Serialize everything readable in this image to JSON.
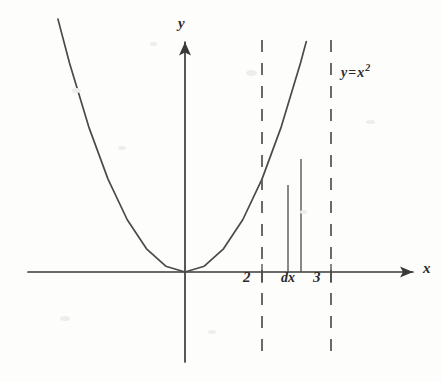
{
  "figure": {
    "kind": "math-graph",
    "background_color": "#fdfdfc",
    "ink_color": "#3a3a3a",
    "width": 442,
    "height": 382
  },
  "axes": {
    "y_axis_label": "y",
    "x_axis_label": "x",
    "y_axis_x_px": 185,
    "x_axis_y_px": 272,
    "x_tick_labels": [
      "2",
      "3"
    ]
  },
  "labels": {
    "curve_equation_lhs": "y",
    "curve_equation_eq": "=",
    "curve_equation_base": "x",
    "curve_equation_exponent": "2",
    "strip_width_label": "dx",
    "tick_2": "2",
    "tick_3": "3"
  },
  "chart_data": {
    "type": "line",
    "title": "",
    "xlabel": "x",
    "ylabel": "y",
    "function": "y = x^2",
    "grid": false,
    "legend": null,
    "xlim": [
      -3.3,
      3.6
    ],
    "ylim": [
      0,
      11
    ],
    "series": [
      {
        "name": "y=x^2",
        "x": [
          -3.3,
          -3.0,
          -2.5,
          -2.0,
          -1.5,
          -1.0,
          -0.5,
          0.0,
          0.5,
          1.0,
          1.5,
          2.0,
          2.5,
          3.0,
          3.15
        ],
        "values": [
          10.89,
          9.0,
          6.25,
          4.0,
          2.25,
          1.0,
          0.25,
          0.0,
          0.25,
          1.0,
          2.25,
          4.0,
          6.25,
          9.0,
          9.92
        ]
      }
    ],
    "annotations": [
      {
        "name": "dashed-boundary-left",
        "type": "vertical-dashed-line",
        "x": 2,
        "label": "2"
      },
      {
        "name": "dashed-boundary-right",
        "type": "vertical-dashed-line",
        "x": 3,
        "label": "3"
      },
      {
        "name": "riemann-strip",
        "type": "vertical-strip",
        "x_start": 2.62,
        "x_end": 3.0,
        "label": "dx",
        "y_start": 0,
        "y_end_left": 6.86,
        "y_end_right": 9.0
      },
      {
        "name": "curve-label",
        "type": "text",
        "text": "y=x²",
        "x": 3.2,
        "y": 10.2
      }
    ]
  },
  "geometry": {
    "curve_points_px": "sampled parabola through origin",
    "dashed_line_2_x_px": 262,
    "dashed_line_3_x_px": 331,
    "dashed_top_y_px": 40,
    "dashed_bottom_y_px": 362,
    "strip_left_x_px": 288,
    "strip_right_x_px": 301,
    "strip_left_top_y_px": 185,
    "strip_right_top_y_px": 159
  }
}
